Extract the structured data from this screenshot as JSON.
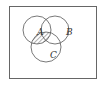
{
  "diagram": {
    "type": "venn",
    "sets": [
      {
        "label": "A",
        "cx": 37,
        "cy": 30,
        "r": 14
      },
      {
        "label": "B",
        "cx": 55,
        "cy": 30,
        "r": 14
      },
      {
        "label": "C",
        "cx": 46,
        "cy": 47,
        "r": 15
      }
    ],
    "shaded_region": "A ∩ C",
    "colors": {
      "line": "#555555",
      "background": "#ffffff",
      "hatch": "#555555"
    }
  }
}
